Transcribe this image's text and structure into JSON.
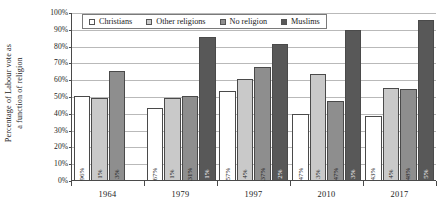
{
  "chart_data": {
    "type": "bar",
    "title": "",
    "xlabel": "",
    "ylabel": "Percentage of Labour vote as a function of religion",
    "ylabel_line1": "Percentage of Labour vote as",
    "ylabel_line2": "a function of religion",
    "categories": [
      "1964",
      "1979",
      "1997",
      "2010",
      "2017"
    ],
    "ylim": [
      0,
      100
    ],
    "ytick_labels": [
      "0%",
      "10%",
      "20%",
      "30%",
      "40%",
      "50%",
      "60%",
      "70%",
      "80%",
      "90%",
      "100%"
    ],
    "ytick_values": [
      0,
      10,
      20,
      30,
      40,
      50,
      60,
      70,
      80,
      90,
      100
    ],
    "grid": true,
    "legend_position": "top-left-inside",
    "series": [
      {
        "name": "Christians",
        "color": "#ffffff",
        "values": [
          50,
          43,
          53,
          39,
          38
        ],
        "point_labels": [
          "96%",
          "67%",
          "57%",
          "47%",
          "43%"
        ]
      },
      {
        "name": "Other religions",
        "color": "#c9c9c9",
        "values": [
          49,
          49,
          60,
          63,
          55
        ],
        "point_labels": [
          "1%",
          "1%",
          "4%",
          "3%",
          "4%"
        ]
      },
      {
        "name": "No religion",
        "color": "#8e8e8e",
        "values": [
          65,
          50,
          67,
          47,
          54
        ],
        "point_labels": [
          "3%",
          "31%",
          "37%",
          "47%",
          "48%"
        ]
      },
      {
        "name": "Muslims",
        "color": "#585858",
        "values": [
          null,
          85,
          81,
          89,
          95
        ],
        "point_labels": [
          "",
          "1%",
          "2%",
          "3%",
          "5%"
        ]
      }
    ]
  }
}
